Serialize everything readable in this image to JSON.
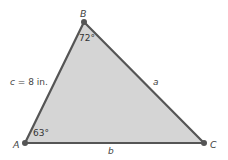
{
  "figure": {
    "type": "triangle",
    "fill_color": "#d5d5d5",
    "stroke_color": "#555555",
    "vertices": {
      "A": {
        "label": "A",
        "x": 25,
        "y": 143
      },
      "B": {
        "label": "B",
        "x": 84,
        "y": 22
      },
      "C": {
        "label": "C",
        "x": 204,
        "y": 143
      }
    },
    "angles": {
      "A": "63°",
      "B": "72°"
    },
    "sides": {
      "c": {
        "var": "c",
        "text": " = 8 in."
      },
      "a": {
        "var": "a"
      },
      "b": {
        "var": "b"
      }
    }
  }
}
